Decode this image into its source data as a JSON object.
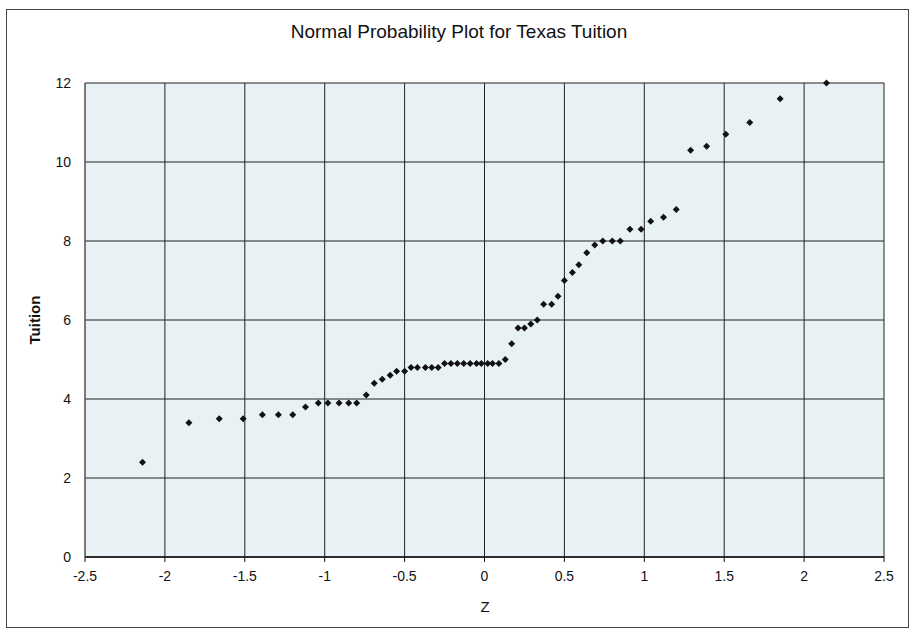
{
  "chart_data": {
    "type": "scatter",
    "title": "Normal Probability Plot for Texas Tuition",
    "xlabel": "Z",
    "ylabel": "Tuition",
    "xlim": [
      -2.5,
      2.5
    ],
    "ylim": [
      0,
      12
    ],
    "x_ticks": [
      "-2.5",
      "-2",
      "-1.5",
      "-1",
      "-0.5",
      "0",
      "0.5",
      "1",
      "1.5",
      "2",
      "2.5"
    ],
    "y_ticks": [
      "0",
      "2",
      "4",
      "6",
      "8",
      "10",
      "12"
    ],
    "grid": true,
    "legend": "none",
    "plot_background": "#e8f1f4",
    "marker_color": "#111111",
    "series": [
      {
        "name": "Tuition",
        "points": [
          [
            -2.14,
            2.4
          ],
          [
            -1.85,
            3.4
          ],
          [
            -1.66,
            3.5
          ],
          [
            -1.51,
            3.5
          ],
          [
            -1.39,
            3.6
          ],
          [
            -1.29,
            3.6
          ],
          [
            -1.2,
            3.6
          ],
          [
            -1.12,
            3.8
          ],
          [
            -1.04,
            3.9
          ],
          [
            -0.98,
            3.9
          ],
          [
            -0.91,
            3.9
          ],
          [
            -0.85,
            3.9
          ],
          [
            -0.8,
            3.9
          ],
          [
            -0.74,
            4.1
          ],
          [
            -0.69,
            4.4
          ],
          [
            -0.64,
            4.5
          ],
          [
            -0.59,
            4.6
          ],
          [
            -0.55,
            4.7
          ],
          [
            -0.5,
            4.7
          ],
          [
            -0.46,
            4.8
          ],
          [
            -0.42,
            4.8
          ],
          [
            -0.37,
            4.8
          ],
          [
            -0.33,
            4.8
          ],
          [
            -0.29,
            4.8
          ],
          [
            -0.25,
            4.9
          ],
          [
            -0.21,
            4.9
          ],
          [
            -0.17,
            4.9
          ],
          [
            -0.13,
            4.9
          ],
          [
            -0.09,
            4.9
          ],
          [
            -0.05,
            4.9
          ],
          [
            -0.02,
            4.9
          ],
          [
            0.02,
            4.9
          ],
          [
            0.05,
            4.9
          ],
          [
            0.09,
            4.9
          ],
          [
            0.13,
            5.0
          ],
          [
            0.17,
            5.4
          ],
          [
            0.21,
            5.8
          ],
          [
            0.25,
            5.8
          ],
          [
            0.29,
            5.9
          ],
          [
            0.33,
            6.0
          ],
          [
            0.37,
            6.4
          ],
          [
            0.42,
            6.4
          ],
          [
            0.46,
            6.6
          ],
          [
            0.5,
            7.0
          ],
          [
            0.55,
            7.2
          ],
          [
            0.59,
            7.4
          ],
          [
            0.64,
            7.7
          ],
          [
            0.69,
            7.9
          ],
          [
            0.74,
            8.0
          ],
          [
            0.8,
            8.0
          ],
          [
            0.85,
            8.0
          ],
          [
            0.91,
            8.3
          ],
          [
            0.98,
            8.3
          ],
          [
            1.04,
            8.5
          ],
          [
            1.12,
            8.6
          ],
          [
            1.2,
            8.8
          ],
          [
            1.29,
            10.3
          ],
          [
            1.39,
            10.4
          ],
          [
            1.51,
            10.7
          ],
          [
            1.66,
            11.0
          ],
          [
            1.85,
            11.6
          ],
          [
            2.14,
            12.0
          ]
        ]
      }
    ]
  }
}
